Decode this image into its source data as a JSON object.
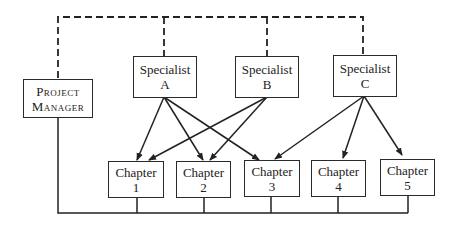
{
  "diagram": {
    "type": "organization-chart",
    "project_manager": {
      "line1": "Project",
      "line2": "Manager"
    },
    "specialists": [
      {
        "id": "A",
        "line1": "Specialist",
        "line2": "A"
      },
      {
        "id": "B",
        "line1": "Specialist",
        "line2": "B"
      },
      {
        "id": "C",
        "line1": "Specialist",
        "line2": "C"
      }
    ],
    "chapters": [
      {
        "id": "1",
        "line1": "Chapter",
        "line2": "1"
      },
      {
        "id": "2",
        "line1": "Chapter",
        "line2": "2"
      },
      {
        "id": "3",
        "line1": "Chapter",
        "line2": "3"
      },
      {
        "id": "4",
        "line1": "Chapter",
        "line2": "4"
      },
      {
        "id": "5",
        "line1": "Chapter",
        "line2": "5"
      }
    ],
    "edges": {
      "dashed": [
        "Project Manager-Specialist A",
        "Project Manager-Specialist B",
        "Project Manager-Specialist C"
      ],
      "arrows": [
        "A->1",
        "A->2",
        "A->3",
        "B->1",
        "B->2",
        "C->3",
        "C->4",
        "C->5"
      ],
      "solid_bus": [
        "Project Manager",
        "Chapter 1",
        "Chapter 2",
        "Chapter 3",
        "Chapter 4",
        "Chapter 5"
      ]
    }
  }
}
